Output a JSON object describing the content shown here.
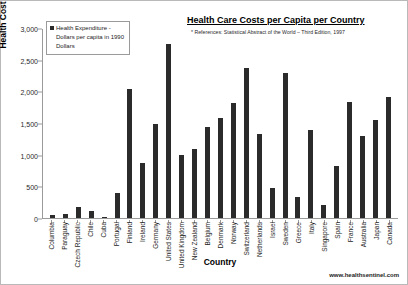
{
  "chart_data": {
    "type": "bar",
    "title": "Health Care Costs per Capita per Country",
    "reference_note": "* References: Statistical Abstract of the World – Third Edition, 1997",
    "xlabel": "Country",
    "ylabel": "Health Cost per Capita",
    "ylim": [
      0,
      3000
    ],
    "ytick_labels": [
      "3,000",
      "2,500",
      "2,000",
      "1,500",
      "1,000",
      "500",
      "0"
    ],
    "ytick_values": [
      3000,
      2500,
      2000,
      1500,
      1000,
      500,
      0
    ],
    "grid": false,
    "legend_position": "top-left",
    "series": [
      {
        "name": "Health Expenditure - Dollars per capita in 1990 Dollars",
        "color": "#2b2b2b",
        "values": [
          50,
          60,
          175,
          110,
          10,
          390,
          2040,
          870,
          1500,
          2770,
          1000,
          1090,
          1450,
          1580,
          1820,
          2380,
          1330,
          480,
          2300,
          330,
          1400,
          200,
          830,
          1840,
          1300,
          1550,
          1920
        ]
      }
    ],
    "categories": [
      "Columbia",
      "Paraguay",
      "Czech Republic",
      "Chile",
      "Cuba",
      "Portugal",
      "Finland",
      "Ireland",
      "Germany",
      "United States",
      "United Kingdom",
      "New Zealand",
      "Belgium",
      "Denmark",
      "Norway",
      "Switzerland",
      "Netherlands",
      "Israel",
      "Sweden",
      "Greece",
      "Italy",
      "Singapore",
      "Spain",
      "France",
      "Australia",
      "Japan",
      "Canada"
    ]
  },
  "legend": {
    "label": "Health Expenditure - Dollars per capita in 1990 Dollars"
  },
  "footer": {
    "website": "www.healthsentinel.com"
  },
  "colors": {
    "bar": "#2b2b2b",
    "axis": "#9a9a9a",
    "text": "#1c1c1c",
    "border": "#b9b9b9"
  }
}
